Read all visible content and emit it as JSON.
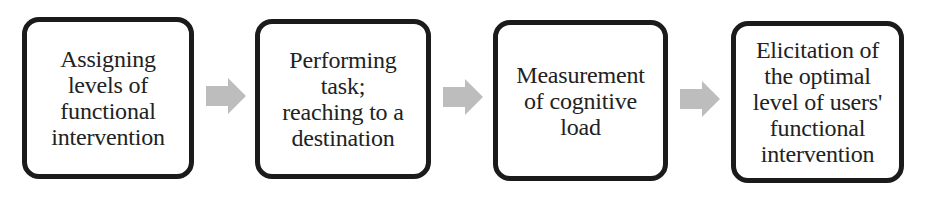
{
  "diagram": {
    "type": "flowchart",
    "direction": "left-to-right",
    "colors": {
      "border": "#1b1b1b",
      "text": "#222222",
      "arrow": "#bdbdbd",
      "background": "#ffffff"
    },
    "steps": [
      {
        "label": "Assigning\nlevels of\nfunctional\nintervention"
      },
      {
        "label": "Performing\ntask;\nreaching to a\ndestination"
      },
      {
        "label": "Measurement\nof cognitive\nload"
      },
      {
        "label": "Elicitation of\nthe optimal\nlevel of users'\nfunctional\nintervention"
      }
    ],
    "arrows": [
      {
        "from": 0,
        "to": 1,
        "icon": "right-arrow-icon"
      },
      {
        "from": 1,
        "to": 2,
        "icon": "right-arrow-icon"
      },
      {
        "from": 2,
        "to": 3,
        "icon": "right-arrow-icon"
      }
    ]
  }
}
